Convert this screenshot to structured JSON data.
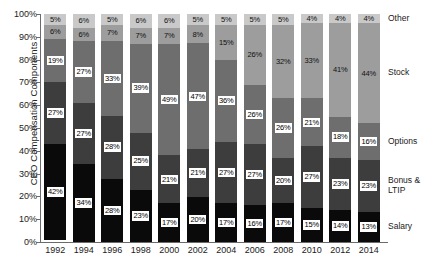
{
  "chart_data": {
    "type": "bar",
    "subtype": "stacked-bar-100",
    "title": "",
    "xlabel": "",
    "ylabel": "CEO Compensation Components",
    "ylim": [
      0,
      100
    ],
    "yunit": "%",
    "grid": false,
    "legend_position": "right",
    "categories": [
      "1992",
      "1994",
      "1996",
      "1998",
      "2000",
      "2002",
      "2004",
      "2006",
      "2008",
      "2010",
      "2012",
      "2014"
    ],
    "y_tick_labels": [
      "100%",
      "90%",
      "80%",
      "70%",
      "60%",
      "50%",
      "40%",
      "30%",
      "20%",
      "10%",
      "0%"
    ],
    "y_ticks": [
      100,
      90,
      80,
      70,
      60,
      50,
      40,
      30,
      20,
      10,
      0
    ],
    "series": [
      {
        "name": "Salary",
        "color": "#0a0a0a",
        "label_style": "boxed",
        "values": [
          42,
          34,
          28,
          23,
          17,
          20,
          17,
          16,
          17,
          15,
          14,
          13
        ]
      },
      {
        "name": "Bonus & LTIP",
        "color": "#3d3d3d",
        "label_style": "boxed",
        "values": [
          27,
          27,
          28,
          25,
          21,
          21,
          27,
          27,
          20,
          27,
          23,
          23
        ]
      },
      {
        "name": "Options",
        "color": "#6e6e6e",
        "label_style": "boxed",
        "values": [
          19,
          27,
          33,
          39,
          49,
          47,
          36,
          26,
          26,
          21,
          18,
          16
        ]
      },
      {
        "name": "Stock",
        "color": "#9d9d9d",
        "label_style": "plain",
        "values": [
          6,
          6,
          7,
          7,
          7,
          8,
          15,
          26,
          32,
          33,
          41,
          44
        ]
      },
      {
        "name": "Other",
        "color": "#c9c9c9",
        "label_style": "plain",
        "values": [
          5,
          6,
          5,
          6,
          6,
          5,
          5,
          5,
          5,
          4,
          4,
          4
        ]
      }
    ],
    "legend_entries": [
      {
        "name": "Other",
        "label": "Other"
      },
      {
        "name": "Stock",
        "label": "Stock"
      },
      {
        "name": "Options",
        "label": "Options"
      },
      {
        "name": "Bonus & LTIP",
        "label": "Bonus &\nLTIP"
      },
      {
        "name": "Salary",
        "label": "Salary"
      }
    ]
  }
}
